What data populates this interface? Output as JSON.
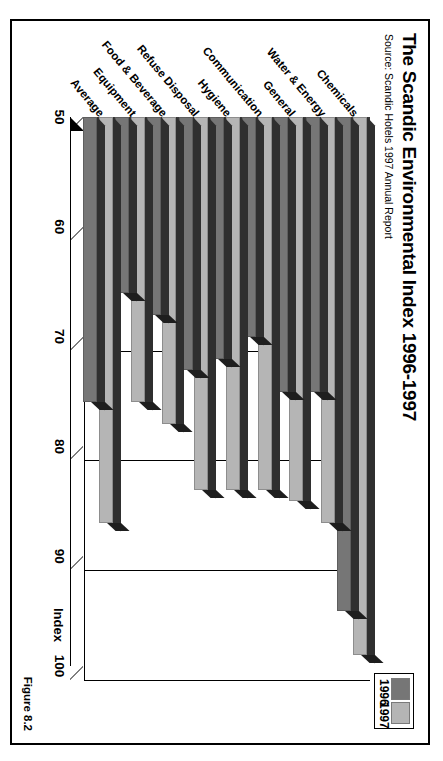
{
  "figure": {
    "title": "The Scandic Environmental Index 1996-1997",
    "source": "Source: Scandic Hotels 1997 Annual Report",
    "figure_label": "Figure 8.2",
    "axis_title": "Index"
  },
  "legend": {
    "items": [
      {
        "label": "1996",
        "color": "#767676"
      },
      {
        "label": "1997",
        "color": "#b5b5b5"
      }
    ]
  },
  "chart_data": {
    "type": "bar",
    "orientation": "horizontal",
    "title": "The Scandic Environmental Index 1996-1997",
    "subtitle": "Source: Scandic Hotels 1997 Annual Report",
    "xlabel": "",
    "ylabel": "Index",
    "ylim": [
      50,
      100
    ],
    "ticks": [
      "50",
      "60",
      "70",
      "80",
      "90",
      "100"
    ],
    "grid": true,
    "legend_position": "top-right",
    "categories": [
      "Chemicals",
      "Water & Energy",
      "General",
      "Communication",
      "Hygiene",
      "Refuse Disposal",
      "Food & Beverage",
      "Equipment",
      "Average"
    ],
    "series": [
      {
        "name": "1996",
        "color": "#767676",
        "values": [
          95,
          75,
          75,
          70,
          72,
          73,
          68,
          66,
          76
        ]
      },
      {
        "name": "1997",
        "color": "#b5b5b5",
        "values": [
          99,
          87,
          85,
          84,
          84,
          84,
          78,
          76,
          87
        ]
      }
    ]
  }
}
